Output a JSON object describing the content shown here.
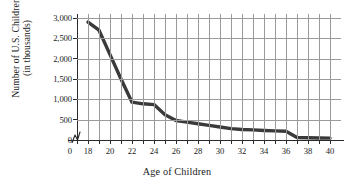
{
  "chart_data": {
    "type": "line",
    "title": "",
    "xlabel": "Age of Children",
    "ylabel_line1": "Number of U.S. Children",
    "ylabel_line2": "(in thousands)",
    "xlim": [
      18,
      40
    ],
    "ylim": [
      0,
      3000
    ],
    "x_tick_labels": [
      "0",
      "18",
      "20",
      "22",
      "24",
      "26",
      "28",
      "30",
      "32",
      "34",
      "36",
      "38",
      "40"
    ],
    "x_ticks": [
      0,
      18,
      20,
      22,
      24,
      26,
      28,
      30,
      32,
      34,
      36,
      38,
      40
    ],
    "y_tick_labels": [
      "0",
      "500",
      "1,000",
      "1,500",
      "2,000",
      "2,500",
      "3,000"
    ],
    "y_ticks": [
      0,
      500,
      1000,
      1500,
      2000,
      2500,
      3000
    ],
    "grid": true,
    "axis_break_x": true,
    "legend": "none",
    "series": [
      {
        "name": "Number of U.S. Children (in thousands)",
        "color": "#3a3a3a",
        "x": [
          18,
          19,
          20,
          21,
          22,
          23,
          24,
          25,
          26,
          27,
          28,
          29,
          30,
          31,
          32,
          33,
          34,
          35,
          36,
          37,
          38,
          39,
          40
        ],
        "values": [
          2900,
          2700,
          2100,
          1500,
          930,
          890,
          870,
          620,
          480,
          440,
          400,
          360,
          320,
          280,
          260,
          250,
          235,
          225,
          215,
          60,
          55,
          50,
          45
        ]
      }
    ]
  },
  "axis": {
    "x_break_symbol": "axis-break-zigzag"
  }
}
